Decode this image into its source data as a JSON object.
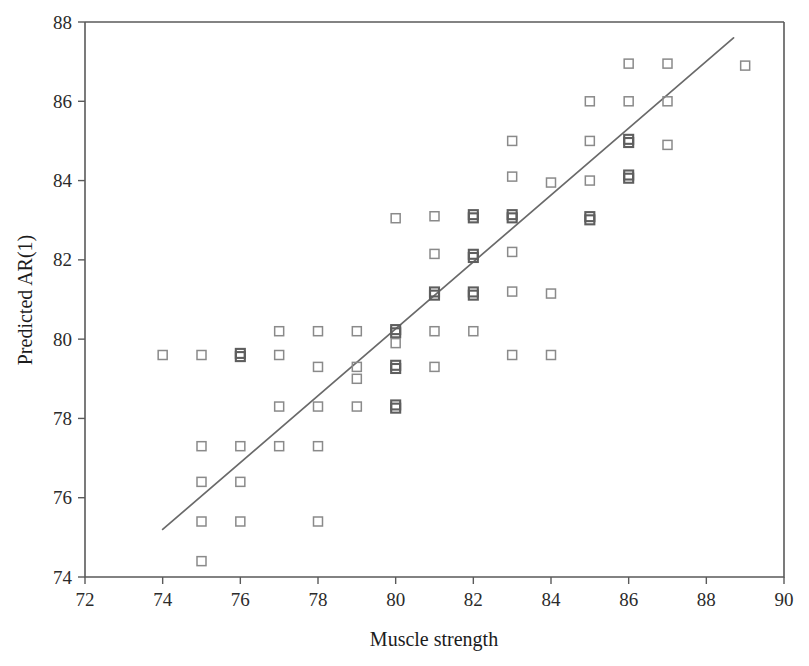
{
  "chart_data": {
    "type": "scatter",
    "title": "",
    "xlabel": "Muscle strength",
    "ylabel": "Predicted AR(1)",
    "xlim": [
      72,
      90
    ],
    "ylim": [
      74,
      88
    ],
    "xticks": [
      72,
      74,
      76,
      78,
      80,
      82,
      84,
      86,
      88,
      90
    ],
    "yticks": [
      74,
      76,
      78,
      80,
      82,
      84,
      86,
      88
    ],
    "grid": false,
    "legend": null,
    "marker_style": "open-square",
    "points": [
      {
        "x": 74,
        "y": 79.6,
        "n": 1
      },
      {
        "x": 75,
        "y": 79.6,
        "n": 1
      },
      {
        "x": 75,
        "y": 77.3,
        "n": 1
      },
      {
        "x": 75,
        "y": 76.4,
        "n": 1
      },
      {
        "x": 75,
        "y": 75.4,
        "n": 1
      },
      {
        "x": 75,
        "y": 74.4,
        "n": 1
      },
      {
        "x": 76,
        "y": 79.6,
        "n": 2
      },
      {
        "x": 76,
        "y": 77.3,
        "n": 1
      },
      {
        "x": 76,
        "y": 76.4,
        "n": 1
      },
      {
        "x": 76,
        "y": 75.4,
        "n": 1
      },
      {
        "x": 77,
        "y": 80.2,
        "n": 1
      },
      {
        "x": 77,
        "y": 79.6,
        "n": 1
      },
      {
        "x": 77,
        "y": 78.3,
        "n": 1
      },
      {
        "x": 77,
        "y": 77.3,
        "n": 1
      },
      {
        "x": 78,
        "y": 80.2,
        "n": 1
      },
      {
        "x": 78,
        "y": 79.3,
        "n": 1
      },
      {
        "x": 78,
        "y": 78.3,
        "n": 1
      },
      {
        "x": 78,
        "y": 77.3,
        "n": 1
      },
      {
        "x": 78,
        "y": 75.4,
        "n": 1
      },
      {
        "x": 79,
        "y": 80.2,
        "n": 1
      },
      {
        "x": 79,
        "y": 79.3,
        "n": 1
      },
      {
        "x": 79,
        "y": 79.0,
        "n": 1
      },
      {
        "x": 79,
        "y": 78.3,
        "n": 1
      },
      {
        "x": 80,
        "y": 83.05,
        "n": 1
      },
      {
        "x": 80,
        "y": 80.2,
        "n": 2
      },
      {
        "x": 80,
        "y": 79.9,
        "n": 1
      },
      {
        "x": 80,
        "y": 79.3,
        "n": 2
      },
      {
        "x": 80,
        "y": 78.3,
        "n": 2
      },
      {
        "x": 81,
        "y": 83.1,
        "n": 1
      },
      {
        "x": 81,
        "y": 82.15,
        "n": 1
      },
      {
        "x": 81,
        "y": 81.15,
        "n": 2
      },
      {
        "x": 81,
        "y": 80.2,
        "n": 1
      },
      {
        "x": 81,
        "y": 79.3,
        "n": 1
      },
      {
        "x": 82,
        "y": 83.1,
        "n": 2
      },
      {
        "x": 82,
        "y": 82.1,
        "n": 2
      },
      {
        "x": 82,
        "y": 81.15,
        "n": 2
      },
      {
        "x": 82,
        "y": 80.2,
        "n": 1
      },
      {
        "x": 83,
        "y": 85.0,
        "n": 1
      },
      {
        "x": 83,
        "y": 84.1,
        "n": 1
      },
      {
        "x": 83,
        "y": 83.1,
        "n": 2
      },
      {
        "x": 83,
        "y": 82.2,
        "n": 1
      },
      {
        "x": 83,
        "y": 81.2,
        "n": 1
      },
      {
        "x": 83,
        "y": 79.6,
        "n": 1
      },
      {
        "x": 84,
        "y": 83.95,
        "n": 1
      },
      {
        "x": 84,
        "y": 81.15,
        "n": 1
      },
      {
        "x": 84,
        "y": 79.6,
        "n": 1
      },
      {
        "x": 85,
        "y": 86.0,
        "n": 1
      },
      {
        "x": 85,
        "y": 85.0,
        "n": 1
      },
      {
        "x": 85,
        "y": 84.0,
        "n": 1
      },
      {
        "x": 85,
        "y": 83.05,
        "n": 2
      },
      {
        "x": 86,
        "y": 86.95,
        "n": 1
      },
      {
        "x": 86,
        "y": 86.0,
        "n": 1
      },
      {
        "x": 86,
        "y": 85.0,
        "n": 2
      },
      {
        "x": 86,
        "y": 84.1,
        "n": 2
      },
      {
        "x": 87,
        "y": 86.95,
        "n": 1
      },
      {
        "x": 87,
        "y": 86.0,
        "n": 1
      },
      {
        "x": 87,
        "y": 84.9,
        "n": 1
      },
      {
        "x": 89,
        "y": 86.9,
        "n": 1
      }
    ],
    "fit_line": {
      "x_start": 74.0,
      "y_start": 75.2,
      "x_end": 88.7,
      "y_end": 87.6
    }
  }
}
